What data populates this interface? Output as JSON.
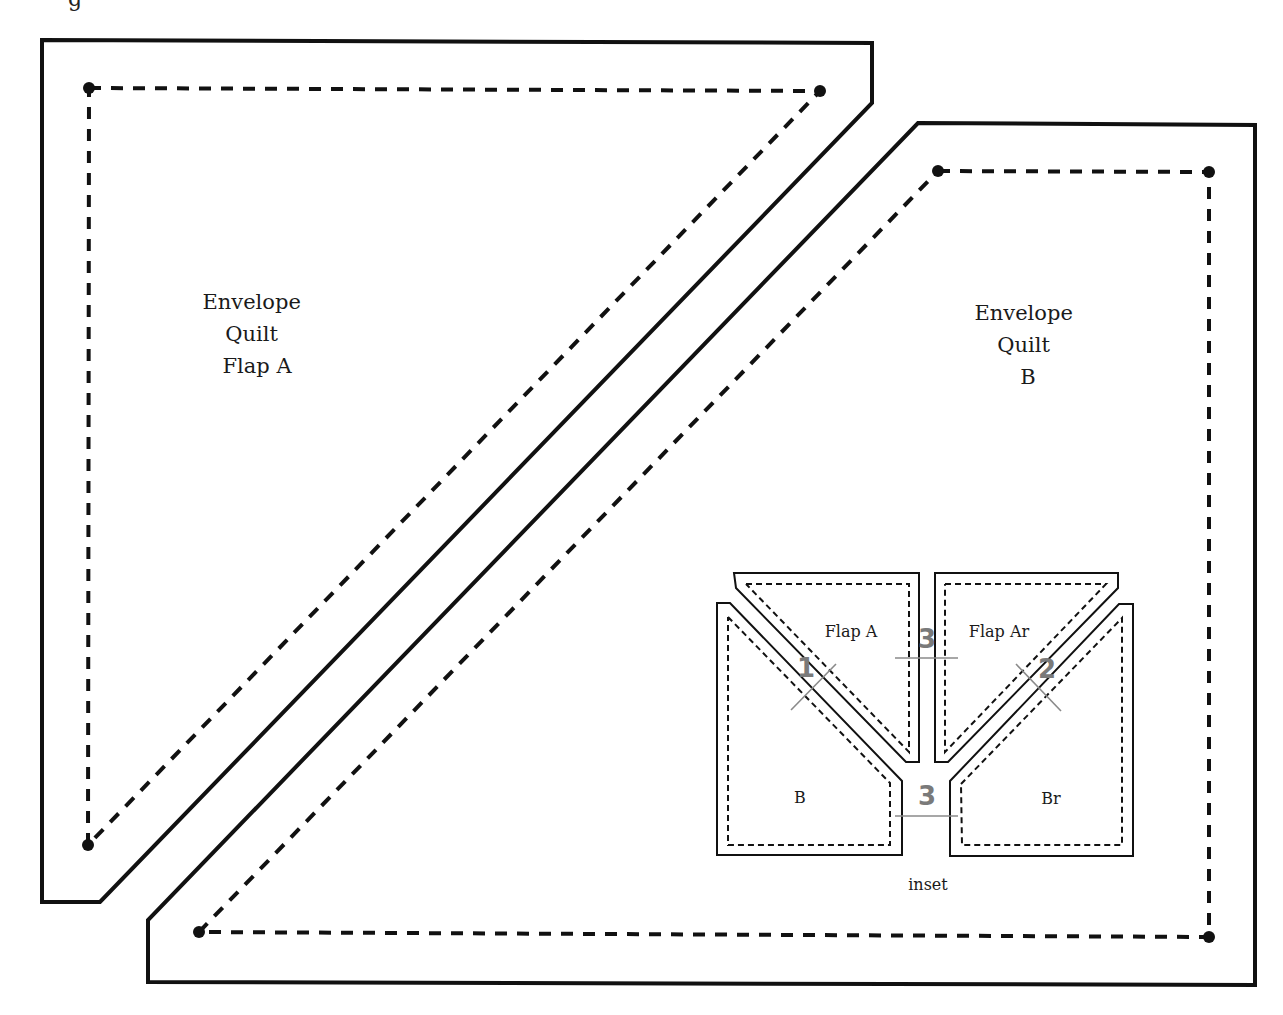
{
  "figure": {
    "title_fragment": "g",
    "pieces": [
      {
        "id": "envelope-quilt-flap-a",
        "label_lines": [
          "Envelope",
          "Quilt",
          "Flap A"
        ]
      },
      {
        "id": "envelope-quilt-b",
        "label_lines": [
          "Envelope",
          "Quilt",
          "B"
        ]
      }
    ],
    "inset": {
      "caption": "inset",
      "pieces": [
        {
          "id": "flap-a",
          "label": "Flap A"
        },
        {
          "id": "flap-ar",
          "label": "Flap Ar"
        },
        {
          "id": "b",
          "label": "B"
        },
        {
          "id": "br",
          "label": "Br"
        }
      ],
      "seam_order": [
        {
          "id": "seam-1",
          "number": "1"
        },
        {
          "id": "seam-2",
          "number": "2"
        },
        {
          "id": "seam-3-top",
          "number": "3"
        },
        {
          "id": "seam-3-bottom",
          "number": "3"
        }
      ]
    },
    "colors": {
      "line": "#111111",
      "seam_number": "#7a7a7a",
      "background": "#ffffff"
    }
  }
}
